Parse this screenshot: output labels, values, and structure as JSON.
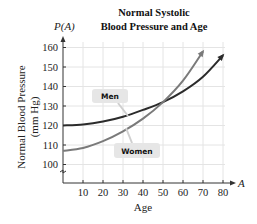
{
  "chart_data": {
    "type": "line",
    "title": "Normal Systolic Blood Pressure and Age",
    "title_lines": [
      "Normal Systolic",
      "Blood Pressure and Age"
    ],
    "function_label": "P(A)",
    "xlabel": "Age",
    "x_var": "A",
    "ylabel_lines": [
      "Normal Blood Pressure",
      "(mm Hg)"
    ],
    "ylabel": "Normal Blood Pressure (mm Hg)",
    "x_ticks": [
      10,
      20,
      30,
      40,
      50,
      60,
      70,
      80
    ],
    "y_ticks": [
      100,
      110,
      120,
      130,
      140,
      150,
      160
    ],
    "xlim": [
      0,
      82
    ],
    "ylim": [
      92,
      163
    ],
    "grid": true,
    "y_axis_break": true,
    "x": [
      0,
      10,
      20,
      30,
      40,
      50,
      60,
      70,
      80
    ],
    "series": [
      {
        "name": "Men",
        "color": "#2b2b2b",
        "values": [
          120,
          120.5,
          122,
          124.5,
          128,
          132,
          137.5,
          145,
          156
        ]
      },
      {
        "name": "Women",
        "color": "#7a7a7a",
        "values": [
          107,
          108.5,
          112,
          117,
          123.5,
          132,
          143,
          158,
          null
        ]
      }
    ],
    "annotations": [
      "Men",
      "Women"
    ]
  }
}
